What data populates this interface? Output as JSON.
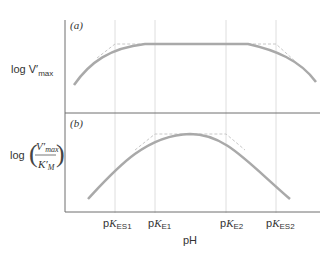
{
  "panels": [
    {
      "label": "(a)",
      "ylabel_main": "log V",
      "ylabel_prime": "′",
      "ylabel_sub": "max"
    },
    {
      "label": "(b)",
      "ylabel_log": "log",
      "num": "V′",
      "num_sub": "max",
      "den": "K′",
      "den_sub": "M"
    }
  ],
  "xaxis": {
    "label": "pH",
    "ticks": [
      {
        "p": "p",
        "k": "K",
        "sub": "ES1"
      },
      {
        "p": "p",
        "k": "K",
        "sub": "E1"
      },
      {
        "p": "p",
        "k": "K",
        "sub": "E2"
      },
      {
        "p": "p",
        "k": "K",
        "sub": "ES2"
      }
    ]
  },
  "colors": {
    "curve": "#a9a9a9",
    "dashed": "#c8c8c8",
    "axis": "#6e6e6e",
    "grid": "#d6d6d6"
  }
}
